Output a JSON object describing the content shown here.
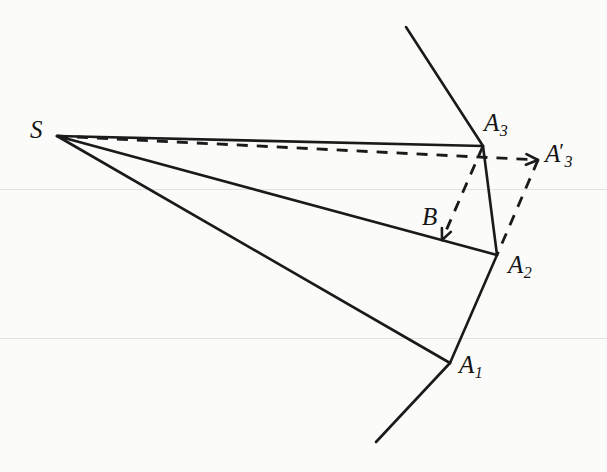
{
  "figure": {
    "background_color": "#fbfbf9",
    "stroke_color": "#1a1a1a",
    "width": 607,
    "height": 472,
    "labels": {
      "source": "S",
      "vertex_a1": "A",
      "vertex_a1_sub": "1",
      "vertex_a2": "A",
      "vertex_a2_sub": "2",
      "vertex_a3": "A",
      "vertex_a3_sub": "3",
      "vertex_a3_prime": "A",
      "vertex_a3_prime_mark": "′",
      "vertex_a3_prime_sub": "3",
      "point_b": "B"
    },
    "points": {
      "S": [
        57,
        136
      ],
      "A1": [
        450,
        363
      ],
      "A2": [
        497,
        255
      ],
      "A3": [
        483,
        146
      ],
      "A3p": [
        538,
        160
      ],
      "B": [
        442,
        240
      ],
      "mirror_top_end": [
        406,
        27
      ],
      "mirror_bottom_end": [
        376,
        442
      ]
    },
    "solid_segments": [
      {
        "name": "ray-s-to-a3",
        "from": "S",
        "to": "A3"
      },
      {
        "name": "ray-s-to-a2",
        "from": "S",
        "to": "A2"
      },
      {
        "name": "ray-s-to-a1",
        "from": "S",
        "to": "A1"
      },
      {
        "name": "mirror-top",
        "from": "mirror_top_end",
        "to": "A3"
      },
      {
        "name": "mirror-a3-a2",
        "from": "A3",
        "to": "A2"
      },
      {
        "name": "mirror-a2-a1",
        "from": "A2",
        "to": "A1"
      },
      {
        "name": "mirror-bottom",
        "from": "A1",
        "to": "mirror_bottom_end"
      }
    ],
    "dashed_segments": [
      {
        "name": "ray-s-to-a3-prime",
        "from": "S",
        "to": "A3p"
      },
      {
        "name": "construction-a3-to-b",
        "from": "A3",
        "to": "B"
      },
      {
        "name": "construction-a3-prime-to-a2",
        "from": "A3p",
        "to": "A2"
      }
    ]
  }
}
